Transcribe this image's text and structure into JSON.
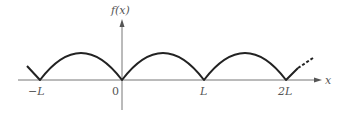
{
  "diagram": {
    "type": "function-graph",
    "axes": {
      "x_label": "x",
      "y_label": "f(x)"
    },
    "ticks": [
      {
        "label": "−L",
        "value": -1
      },
      {
        "label": "0",
        "value": 0
      },
      {
        "label": "L",
        "value": 1
      },
      {
        "label": "2L",
        "value": 2
      }
    ],
    "curve_color": "#222222",
    "axis_color": "#666666"
  }
}
